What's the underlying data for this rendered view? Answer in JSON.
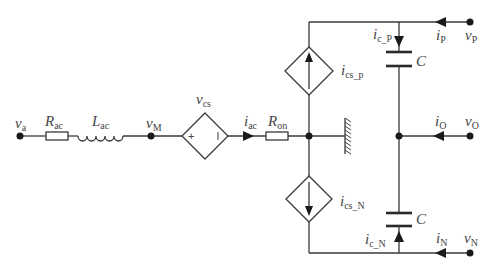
{
  "diagram": {
    "type": "circuit-schematic",
    "labels": {
      "v_a": {
        "main": "v",
        "sub": "a"
      },
      "R_ac": {
        "main": "R",
        "sub": "ac"
      },
      "L_ac": {
        "main": "L",
        "sub": "ac"
      },
      "v_M": {
        "main": "v",
        "sub": "M"
      },
      "v_cs": {
        "main": "v",
        "sub": "cs"
      },
      "i_ac": {
        "main": "i",
        "sub": "ac"
      },
      "R_on": {
        "main": "R",
        "sub": "on"
      },
      "i_cs_p": {
        "main": "i",
        "sub": "cs_p"
      },
      "i_cs_N": {
        "main": "i",
        "sub": "cs_N"
      },
      "i_c_P": {
        "main": "i",
        "sub": "c_P"
      },
      "i_c_N": {
        "main": "i",
        "sub": "c_N"
      },
      "C_top": {
        "main": "C"
      },
      "C_bottom": {
        "main": "C"
      },
      "i_P": {
        "main": "i",
        "sub": "P"
      },
      "v_P": {
        "main": "v",
        "sub": "P"
      },
      "i_O": {
        "main": "i",
        "sub": "O"
      },
      "v_O": {
        "main": "v",
        "sub": "O"
      },
      "i_N": {
        "main": "i",
        "sub": "N"
      },
      "v_N": {
        "main": "v",
        "sub": "N"
      }
    },
    "voltage_source_signs": {
      "plus": "+",
      "minus": "−"
    }
  }
}
